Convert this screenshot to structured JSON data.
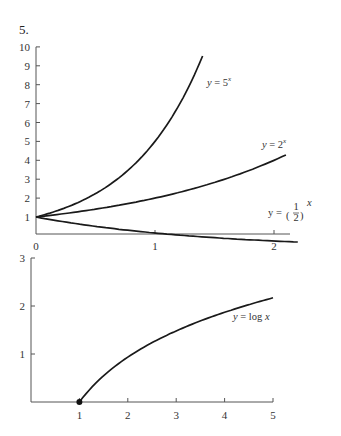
{
  "problem_number": "5.",
  "chart_data": [
    {
      "type": "line",
      "title": "",
      "xlabel": "",
      "ylabel": "",
      "xlim": [
        0,
        2.3
      ],
      "ylim": [
        0.5,
        10
      ],
      "x_ticks": [
        0,
        1,
        2
      ],
      "x_tick_labels": [
        "0",
        "1",
        "2"
      ],
      "y_ticks": [
        1,
        2,
        3,
        4,
        5,
        6,
        7,
        8,
        9,
        10
      ],
      "y_tick_labels": [
        "1",
        "2",
        "3",
        "4",
        "5",
        "6",
        "7",
        "8",
        "9",
        "10"
      ],
      "grid": false,
      "series": [
        {
          "name": "y = 5^x",
          "label_main": "y = 5",
          "label_exp": "x",
          "function": "5^x",
          "x_range": [
            0,
            1.4
          ],
          "x": [
            0,
            0.2,
            0.4,
            0.6,
            0.8,
            1.0,
            1.2,
            1.4
          ],
          "values": [
            1,
            1.38,
            1.9,
            2.63,
            3.62,
            5.0,
            6.9,
            9.52
          ]
        },
        {
          "name": "y = 2^x",
          "label_main": "y = 2",
          "label_exp": "x",
          "function": "2^x",
          "x_range": [
            0,
            2.1
          ],
          "x": [
            0,
            0.5,
            1.0,
            1.5,
            2.0,
            2.1
          ],
          "values": [
            1,
            1.41,
            2.0,
            2.83,
            4.0,
            4.29
          ]
        },
        {
          "name": "y = (1/2)^x",
          "label_main": "y =",
          "label_frac_num": "1",
          "label_frac_den": "2",
          "label_exp": "x",
          "function": "(1/2)^x",
          "x_range": [
            0,
            2.2
          ],
          "x": [
            0,
            0.5,
            1.0,
            1.5,
            2.0,
            2.2
          ],
          "values": [
            1,
            0.71,
            0.5,
            0.35,
            0.25,
            0.22
          ]
        }
      ]
    },
    {
      "type": "line",
      "title": "",
      "xlabel": "",
      "ylabel": "",
      "xlim": [
        0,
        5
      ],
      "ylim": [
        0,
        3
      ],
      "x_ticks": [
        1,
        2,
        3,
        4,
        5
      ],
      "x_tick_labels": [
        "1",
        "2",
        "3",
        "4",
        "5"
      ],
      "y_ticks": [
        1,
        2,
        3
      ],
      "y_tick_labels": [
        "1",
        "2",
        "3"
      ],
      "grid": false,
      "series": [
        {
          "name": "y = log x",
          "label_main": "y = log",
          "label_var": "x",
          "function": "log x",
          "x_range": [
            1,
            5
          ],
          "x": [
            1,
            2,
            3,
            4,
            5
          ],
          "values": [
            0,
            0.94,
            1.48,
            1.87,
            2.17
          ],
          "marker_point": [
            1,
            0
          ]
        }
      ]
    }
  ]
}
